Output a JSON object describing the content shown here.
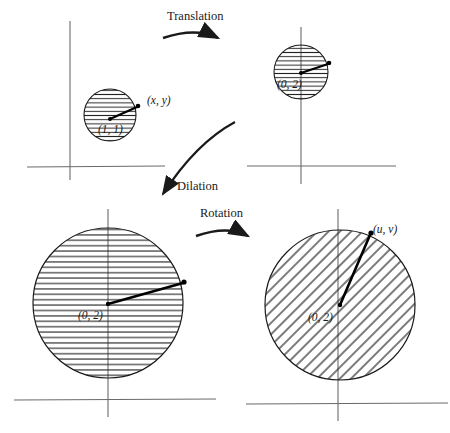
{
  "figure": {
    "background_color": "#ffffff",
    "ink_color": "#1a1a1a",
    "axis_color": "#666666"
  },
  "operations": [
    {
      "id": "translation",
      "label": "Translation",
      "label_x": 225,
      "label_y": 16,
      "arrow": "curved-right"
    },
    {
      "id": "dilation",
      "label": "Dilation",
      "label_x": 199,
      "label_y": 187,
      "arrow": "curved-down-left"
    },
    {
      "id": "rotation",
      "label": "Rotation",
      "label_x": 224,
      "label_y": 213,
      "arrow": "curved-right"
    }
  ],
  "panels": [
    {
      "id": "original",
      "circle": {
        "cx": 110,
        "cy": 115,
        "r": 26,
        "hatch": "horizontal"
      },
      "axis": {
        "x_min": 27,
        "x_max": 165,
        "y_axis_x": 70,
        "x_axis_y": 167,
        "y_min": 21,
        "y_max": 180
      },
      "center_label": {
        "text": "(1, 1)",
        "x": 98,
        "y": 132
      },
      "tip_label": {
        "text": "(x, y)",
        "x": 148,
        "y": 103
      },
      "vector": {
        "x1": 110,
        "y1": 119,
        "x2": 138,
        "y2": 107
      }
    },
    {
      "id": "translated",
      "circle": {
        "cx": 301,
        "cy": 72,
        "r": 27,
        "hatch": "horizontal"
      },
      "axis": {
        "x_min": 247,
        "x_max": 396,
        "y_axis_x": 301,
        "x_axis_y": 166,
        "y_min": 27,
        "y_max": 184
      },
      "center_label": {
        "text": "(0, 2)",
        "x": 277,
        "y": 87
      },
      "tip_label": {
        "text": "",
        "x": 0,
        "y": 0
      },
      "vector": {
        "x1": 301,
        "y1": 73,
        "x2": 329,
        "y2": 64
      }
    },
    {
      "id": "dilated",
      "circle": {
        "cx": 108,
        "cy": 303,
        "r": 75,
        "hatch": "horizontal"
      },
      "axis": {
        "x_min": 14,
        "x_max": 216,
        "y_axis_x": 108,
        "x_axis_y": 400,
        "y_min": 209,
        "y_max": 417
      },
      "center_label": {
        "text": "(0, 2)",
        "x": 78,
        "y": 318
      },
      "tip_label": {
        "text": "",
        "x": 0,
        "y": 0
      },
      "vector": {
        "x1": 108,
        "y1": 304,
        "x2": 184,
        "y2": 283
      }
    },
    {
      "id": "rotated",
      "circle": {
        "cx": 340,
        "cy": 305,
        "r": 75,
        "hatch": "diagonal"
      },
      "axis": {
        "x_min": 246,
        "x_max": 448,
        "y_axis_x": 338,
        "x_axis_y": 404,
        "y_min": 209,
        "y_max": 421
      },
      "center_label": {
        "text": "(0, 2)",
        "x": 308,
        "y": 320
      },
      "tip_label": {
        "text": "(u, v)",
        "x": 374,
        "y": 232
      },
      "vector": {
        "x1": 340,
        "y1": 305,
        "x2": 371,
        "y2": 233
      }
    }
  ]
}
